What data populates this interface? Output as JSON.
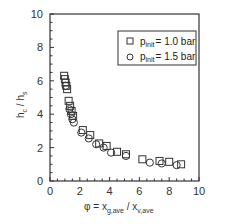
{
  "chart_data": {
    "type": "scatter",
    "title": "",
    "xlabel": "φ = x_g,ave / x_v,ave",
    "ylabel": "h_c / h_s",
    "xlim": [
      0,
      10
    ],
    "ylim": [
      0,
      10
    ],
    "x_ticks": [
      "0",
      "2",
      "4",
      "6",
      "8",
      "10"
    ],
    "y_ticks": [
      "0",
      "2",
      "4",
      "6",
      "8",
      "10"
    ],
    "grid": false,
    "legend_position": "upper right",
    "series": [
      {
        "name": "p_init = 1.0 bar",
        "marker": "square",
        "points": [
          [
            0.95,
            6.3
          ],
          [
            1.0,
            6.1
          ],
          [
            1.05,
            5.9
          ],
          [
            1.1,
            5.7
          ],
          [
            1.15,
            5.5
          ],
          [
            1.25,
            4.8
          ],
          [
            1.35,
            4.5
          ],
          [
            1.45,
            4.2
          ],
          [
            1.55,
            3.9
          ],
          [
            2.2,
            3.05
          ],
          [
            2.7,
            2.75
          ],
          [
            3.3,
            2.25
          ],
          [
            3.8,
            2.1
          ],
          [
            4.5,
            1.75
          ],
          [
            5.1,
            1.6
          ],
          [
            6.2,
            1.3
          ],
          [
            7.35,
            1.2
          ],
          [
            8.0,
            1.15
          ],
          [
            8.8,
            1.0
          ]
        ]
      },
      {
        "name": "p_init = 1.5 bar",
        "marker": "circle",
        "points": [
          [
            1.05,
            5.7
          ],
          [
            1.3,
            4.3
          ],
          [
            1.4,
            4.0
          ],
          [
            1.5,
            3.7
          ],
          [
            1.6,
            3.5
          ],
          [
            2.1,
            2.9
          ],
          [
            2.6,
            2.55
          ],
          [
            3.1,
            2.2
          ],
          [
            3.6,
            2.0
          ],
          [
            4.1,
            1.7
          ],
          [
            5.1,
            1.5
          ],
          [
            6.7,
            1.1
          ],
          [
            7.5,
            1.05
          ],
          [
            8.5,
            0.95
          ]
        ]
      }
    ]
  },
  "legend": {
    "items": [
      {
        "symbol": "square",
        "prefix": "p",
        "sub": "init",
        "suffix": "= 1.0 bar"
      },
      {
        "symbol": "circle",
        "prefix": "p",
        "sub": "init",
        "suffix": "= 1.5 bar"
      }
    ]
  },
  "axes": {
    "x_label_main": "φ = x",
    "x_label_sub1": "g,ave",
    "x_label_mid": " / x",
    "x_label_sub2": "v,ave",
    "y_label_main1": "h",
    "y_label_sub1": "c",
    "y_label_mid": " / h",
    "y_label_sub2": "s"
  }
}
